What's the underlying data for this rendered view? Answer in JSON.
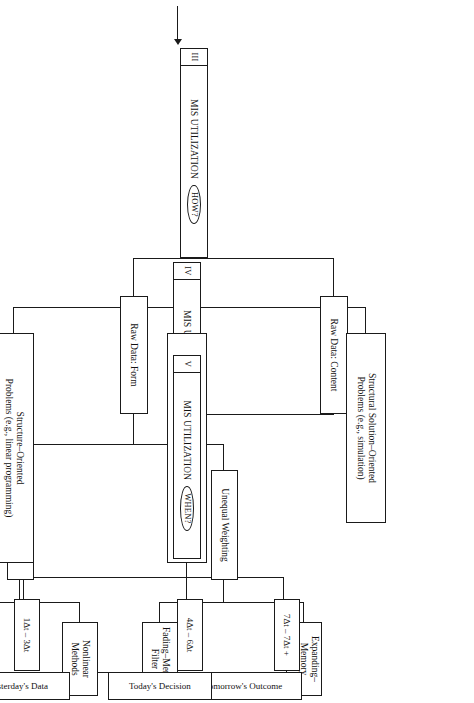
{
  "figure": {
    "orientation": "rotated-90",
    "ink_color": "#1a1a1a",
    "background": "#ffffff"
  },
  "levels": [
    {
      "numeral": "III",
      "title": "MIS UTILIZATION",
      "question": "HOW?"
    },
    {
      "numeral": "IV",
      "title": "MIS UTILIZATION",
      "question": "HOW?"
    },
    {
      "numeral": "V",
      "title": "MIS UTILIZATION",
      "question": "WHEN?"
    }
  ],
  "nodes": {
    "raw_data_content": "Raw Data:  Content",
    "raw_data_form": "Raw Data:  Form",
    "unequal_weighting": "Unequal Weighting",
    "equal_weighting": "Equal Weighting",
    "expanding_memory_filter": "Expanding–Memory\nFilter",
    "expanding_memory_filter_l1": "Expanding–Memory",
    "expanding_memory_filter_l2": "Filter",
    "fading_memory_filter_l1": "Fading–Memory",
    "fading_memory_filter_l2": "Filter",
    "nonlinear_methods_l1": "Nonlinear",
    "nonlinear_methods_l2": "Methods",
    "linear_methods": "Linear Methods",
    "structural_solution_oriented_l1": "Structural Solution–Oriented",
    "structural_solution_oriented_l2": "Problems (e.g., simulation)",
    "solution_oriented_l1": "Solution–Oriented",
    "solution_oriented_l2": "Problems (e.g., dynamic programming)",
    "structure_oriented_l1": "Structure–Oriented",
    "structure_oriented_l2": "Problems (e.g., linear programming)",
    "time_1": "1Δt – 3Δt",
    "time_2": "4Δt – 6Δt",
    "time_3": "7Δt – 7Δt +",
    "horizon_1": "Yesterday's Data",
    "horizon_2": "Today's Decision",
    "horizon_3": "Tomorrow's Outcome"
  }
}
